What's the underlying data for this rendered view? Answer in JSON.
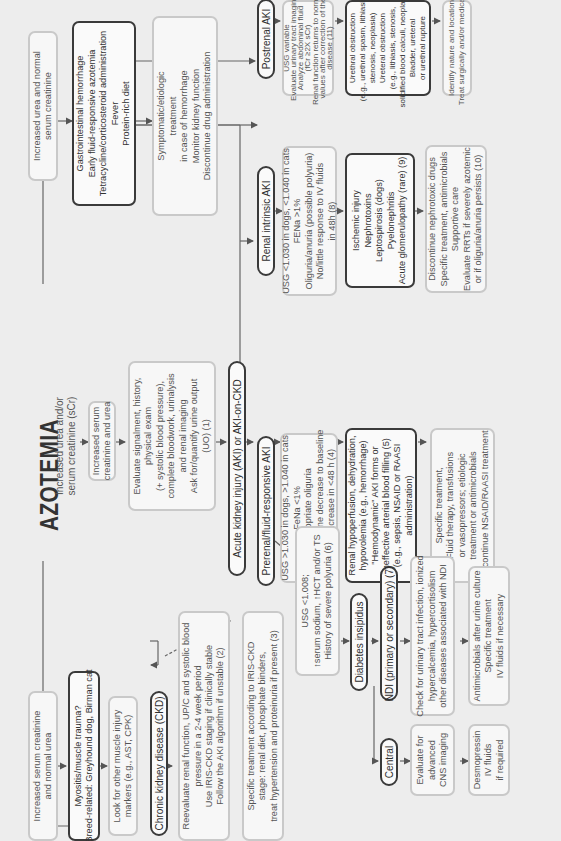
{
  "title": "AZOTEMIA",
  "subtitle_lines": [
    "Increased urea and/or",
    "serum creatinine (sCr)"
  ],
  "left_branch": {
    "muscle_start": [
      "Increased serum creatinine",
      "and normal urea"
    ],
    "muscle_cause": [
      "Myositis/muscle trauma?",
      "Breed-related: Greyhound dog, Birman cat"
    ],
    "muscle_action": [
      "Look for other muscle injury",
      "markers (e.g., AST, CPK)"
    ]
  },
  "right_branch": {
    "urea_start": [
      "Increased urea and normal",
      "serum creatinine"
    ],
    "urea_cause": [
      "Gastrointestinal hemorrhage",
      "Early fluid-responsive azotemia",
      "Tetracycline/corticosteroid administration",
      "Fever",
      "Protein-rich diet"
    ],
    "urea_action": [
      "Symptomatic/etiologic",
      "treatment",
      "in case of hemorrhage",
      "Monitor kidney function",
      "Discontinue drug administration"
    ]
  },
  "center": {
    "both_increased": [
      "Increased serum",
      "creatinine and urea"
    ],
    "evaluate": [
      "Evaluate signalment, history,",
      "physical exam",
      "(+ systolic blood pressure),",
      "complete bloodwork, urinalysis",
      "and renal imaging",
      "Ask for/quantify urine output",
      "(UO) (1)"
    ],
    "aki_label": "Acute kidney injury (AKI) or AKI-on-CKD"
  },
  "ckd": {
    "label": "Chronic kidney disease (CKD)",
    "reevaluate": [
      "Reevaluate renal function, UP/C and systolic blood",
      "pressure in a 2-4 week period",
      "Use IRIS-CKD staging if clinically stable",
      "Follow the AKI algorithm if unstable (2)"
    ],
    "treatment": [
      "Specific treatment according to IRIS-CKD",
      "stage: renal diet, phosphate binders,",
      "treat hypertension and proteinuria if present (3)"
    ]
  },
  "prerenal": {
    "label": "Prerenal/fluid-responsive AKI",
    "criteria": [
      "USG >1.030 in dogs, >1.040 in cats",
      "FeNa <1%",
      "Appropriate oliguria",
      "Serum creatinine decrease to baseline",
      "and UO increase in <48 h (4)"
    ],
    "causes": [
      "Renal hypoperfusion, dehydration,",
      "hypovolemia (e.g., hemorrhage)",
      "\"Hemodynamic\" AKI forms or",
      "Ineffective arterial blood filling (5)",
      "(e.g., sepsis, NSAID or RAASI",
      "administration)"
    ],
    "treatment": [
      "Specific treatment,",
      "Fluid therapy, transfusions",
      "or vasopressors; etiologic",
      "treatment or antimicrobials",
      "Discontinue NSAID/RAASI treatment"
    ]
  },
  "polyuria": {
    "criteria": [
      "USG <1.008;",
      "↑serum sodium, ↑HCT and/or TS",
      "History of severe polyuria (6)"
    ],
    "di_label": "Diabetes insipidus",
    "ndi_label": "NDI (primary or secondary) (7)",
    "ndi_check": [
      "Check for urinary tract infection, ionized",
      "hypercalcemia, hypercortisolism",
      "other diseases associated with NDI"
    ],
    "ndi_treatment": [
      "Antimicrobials after urine culture",
      "Specific treatment",
      "IV fluids if necessary"
    ],
    "central_label": "Central",
    "central_eval": [
      "Evaluate for",
      "advanced",
      "CNS imaging"
    ],
    "central_treatment": [
      "Desmopressin",
      "IV fluids",
      "if required"
    ]
  },
  "intrinsic": {
    "label": "Renal intrinsic AKI",
    "criteria": [
      "USG <1.030 in dogs, <1.040 in cats",
      "FENa >1%",
      "Oliguria/anuria (possible polyuria)",
      "No/little response to IV fluids",
      "in 48h (8)"
    ],
    "causes": [
      "Ischemic injury",
      "Nephrotoxins",
      "Leptospirosis (dogs)",
      "Pyelonephritis",
      "Acute glomerulopathy (rare) (9)"
    ],
    "treatment": [
      "Discontinue nephrotoxic drugs",
      "Specific treatment, antimicrobials",
      "Supportive care",
      "Evaluate RRTs if severely azotemic",
      "or if oliguria/anuria persists (10)"
    ]
  },
  "postrenal": {
    "label": "Postrenal AKI",
    "criteria": [
      "USG variable",
      "Evaluate urinary tract imaging",
      "Analyze abdominal fluid",
      "(fCr ≥2X sCr)",
      "Renal function returns to normal",
      "values after correction of the",
      "disease (11)"
    ],
    "causes": [
      "Urethral obstruction",
      "(e.g., urethral spasm, lithiasis,",
      "stenosis, neoplasia)",
      "Ureteral obstruction",
      "(e.g., lithiasis, stenosis,",
      "solidified blood calculi, neoplasia)",
      "Bladder, ureteral",
      "or urethral rupture"
    ],
    "treatment": [
      "Identify nature and location",
      "Treat surgically and/or medically"
    ]
  },
  "colors": {
    "background": "#ededed",
    "box_border_light": "#c9c9c9",
    "box_border_dark": "#3a3a3a",
    "text": "#555555",
    "arrow": "#555555"
  }
}
